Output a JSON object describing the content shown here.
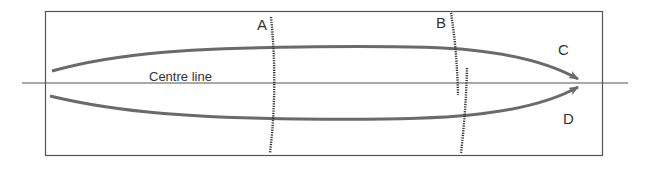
{
  "diagram": {
    "centre_line_label": "Centre line",
    "labels": {
      "A": "A",
      "B": "B",
      "C": "C",
      "D": "D"
    },
    "colors": {
      "frame": "#555555",
      "curve": "#6a6a6a",
      "centre_line": "#555555",
      "hatch": "#333333",
      "text": "#333333"
    }
  }
}
